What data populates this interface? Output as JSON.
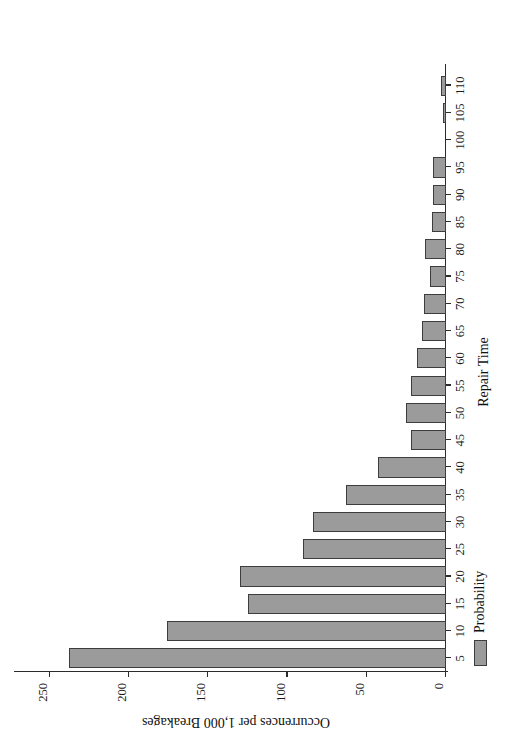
{
  "chart_data": {
    "type": "bar",
    "orientation": "vertical",
    "title": "",
    "subtitle": "",
    "xlabel": "Repair Time",
    "ylabel": "Occurrences per 1,000 Breakages",
    "categories": [
      "5",
      "10",
      "15",
      "20",
      "25",
      "30",
      "35",
      "40",
      "45",
      "50",
      "55",
      "60",
      "65",
      "70",
      "75",
      "80",
      "85",
      "90",
      "95",
      "100",
      "105",
      "110"
    ],
    "xtick_labels": [
      "5",
      "10",
      "15",
      "20",
      "25",
      "30",
      "35",
      "40",
      "45",
      "50",
      "55",
      "60",
      "65",
      "70",
      "75",
      "80",
      "85",
      "90",
      "95",
      "100",
      "105",
      "110"
    ],
    "ytick_labels": [
      "0",
      "50",
      "100",
      "150",
      "200",
      "250"
    ],
    "yticks": [
      0,
      50,
      100,
      150,
      200,
      250
    ],
    "ylim": [
      0,
      265
    ],
    "values": [
      238,
      176,
      125,
      130,
      90,
      84,
      63,
      43,
      22,
      25,
      22,
      18,
      15,
      14,
      10,
      13,
      9,
      8,
      8,
      0,
      2,
      3
    ],
    "series": [
      {
        "name": "Probability",
        "color": "#9b9b9b",
        "edge_color": "#3d3d3d",
        "values": [
          238,
          176,
          125,
          130,
          90,
          84,
          63,
          43,
          22,
          25,
          22,
          18,
          15,
          14,
          10,
          13,
          9,
          8,
          8,
          0,
          2,
          3
        ]
      }
    ],
    "legend": {
      "position": "bottom-right",
      "entries": [
        {
          "label": "Probability",
          "color": "#9b9b9b",
          "edge_color": "#3d3d3d"
        }
      ]
    },
    "grid": false,
    "axis_color": "#2b2b2b",
    "background": "#ffffff",
    "rotation_degrees": -90
  }
}
